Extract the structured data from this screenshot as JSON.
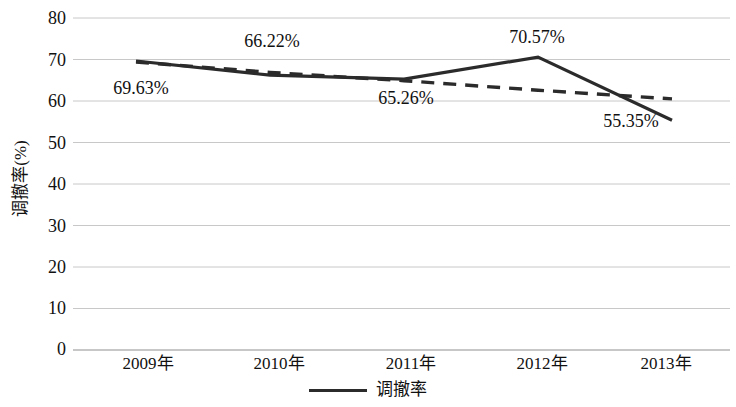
{
  "chart_data": {
    "type": "line",
    "title": "",
    "xlabel": "",
    "ylabel": "调撤率(%)",
    "categories": [
      "2009年",
      "2010年",
      "2011年",
      "2012年",
      "2013年"
    ],
    "series": [
      {
        "name": "调撤率",
        "style": "solid",
        "color": "#2b2b2b",
        "values": [
          69.63,
          66.22,
          65.26,
          70.57,
          55.35
        ],
        "data_labels": [
          "69.63%",
          "66.22%",
          "65.26%",
          "70.57%",
          "55.35%"
        ]
      },
      {
        "name": "线性 (调撤率)",
        "style": "dashed",
        "color": "#2b2b2b",
        "values": [
          69.4,
          66.9,
          64.9,
          62.6,
          60.5
        ]
      }
    ],
    "ylim": [
      0,
      80
    ],
    "ytick_step": 10,
    "yticks": [
      "80",
      "70",
      "60",
      "50",
      "40",
      "30",
      "20",
      "10",
      "0"
    ],
    "grid": true,
    "grid_color": "#c8c8c8",
    "legend_position": "bottom-center",
    "legend": [
      {
        "label": "调撤率",
        "marker": "solid-line",
        "color": "#2b2b2b"
      }
    ]
  }
}
